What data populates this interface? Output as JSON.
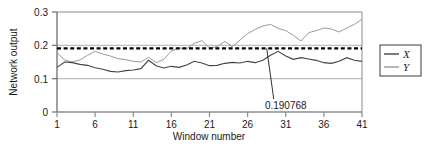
{
  "chart_data": {
    "type": "line",
    "title": "",
    "xlabel": "Window number",
    "ylabel": "Network output",
    "xlim": [
      1,
      41
    ],
    "ylim": [
      0,
      0.3
    ],
    "xticks": [
      1,
      6,
      11,
      16,
      21,
      26,
      31,
      36,
      41
    ],
    "xtick_labels": [
      "1",
      "6",
      "11",
      "16",
      "21",
      "26",
      "31",
      "36",
      "41"
    ],
    "yticks": [
      0,
      0.1,
      0.2,
      0.3
    ],
    "ytick_labels": [
      "0",
      "0.1",
      "0.2",
      "0.3"
    ],
    "grid": true,
    "gridlines_y": [
      0.1,
      0.2,
      0.3
    ],
    "legend_position": "right-outside",
    "x": [
      1,
      2,
      3,
      4,
      5,
      6,
      7,
      8,
      9,
      10,
      11,
      12,
      13,
      14,
      15,
      16,
      17,
      18,
      19,
      20,
      21,
      22,
      23,
      24,
      25,
      26,
      27,
      28,
      29,
      30,
      31,
      32,
      33,
      34,
      35,
      36,
      37,
      38,
      39,
      40,
      41
    ],
    "series": [
      {
        "name": "X",
        "color": "#444444",
        "style": "solid",
        "values": [
          0.134,
          0.15,
          0.148,
          0.143,
          0.14,
          0.133,
          0.128,
          0.122,
          0.12,
          0.124,
          0.126,
          0.13,
          0.155,
          0.139,
          0.132,
          0.137,
          0.134,
          0.141,
          0.152,
          0.147,
          0.139,
          0.14,
          0.146,
          0.149,
          0.147,
          0.152,
          0.148,
          0.155,
          0.17,
          0.182,
          0.168,
          0.158,
          0.163,
          0.159,
          0.155,
          0.148,
          0.146,
          0.152,
          0.163,
          0.155,
          0.152
        ]
      },
      {
        "name": "Y",
        "color": "#9a9a9a",
        "style": "solid",
        "values": [
          0.178,
          0.156,
          0.15,
          0.156,
          0.17,
          0.182,
          0.174,
          0.168,
          0.16,
          0.157,
          0.152,
          0.15,
          0.164,
          0.148,
          0.158,
          0.183,
          0.192,
          0.19,
          0.206,
          0.214,
          0.192,
          0.196,
          0.212,
          0.196,
          0.216,
          0.235,
          0.248,
          0.258,
          0.263,
          0.251,
          0.244,
          0.23,
          0.213,
          0.238,
          0.244,
          0.252,
          0.249,
          0.24,
          0.252,
          0.263,
          0.278
        ]
      }
    ],
    "reference_line": {
      "name": "threshold",
      "value": 0.190768,
      "style": "dashed",
      "color": "#000000",
      "label": "0.190768"
    },
    "annotation": {
      "text": "0.190768",
      "x_data": 31,
      "y_data": 0.075,
      "points_to_x": 28.5,
      "points_to_y": 0.1908
    },
    "legend": {
      "entries": [
        {
          "label": "X",
          "color": "#444444"
        },
        {
          "label": "Y",
          "color": "#9a9a9a"
        }
      ]
    }
  }
}
